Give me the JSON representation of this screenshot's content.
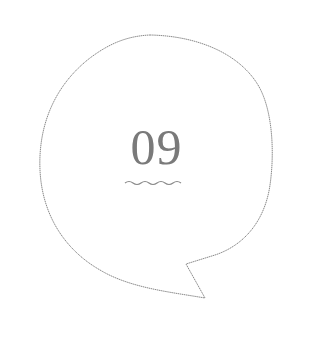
{
  "badge": {
    "number": "09",
    "shape": "speech-bubble",
    "underline": "wavy"
  },
  "colors": {
    "outline": "#8a8a8a",
    "number": "#7a7a7a",
    "underline": "#8a8a8a",
    "background": "#ffffff"
  }
}
